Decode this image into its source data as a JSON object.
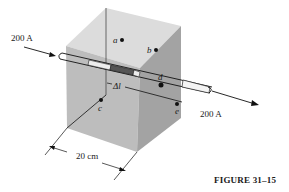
{
  "figure": {
    "caption": "FIGURE 31–15",
    "type": "3D cube with current-carrying wire passing through"
  },
  "labels": {
    "current_in": "200 A",
    "current_out": "200 A",
    "segment": "Δl",
    "dimension": "20 cm",
    "point_a": "a",
    "point_b": "b",
    "point_c": "c",
    "point_d": "d",
    "point_e": "e"
  },
  "colors": {
    "face_top": "#d9d9d9",
    "face_front": "#b9b9b9",
    "face_right": "#9a9a9a",
    "segment_fill": "#555555",
    "line": "#1a1a1a"
  }
}
